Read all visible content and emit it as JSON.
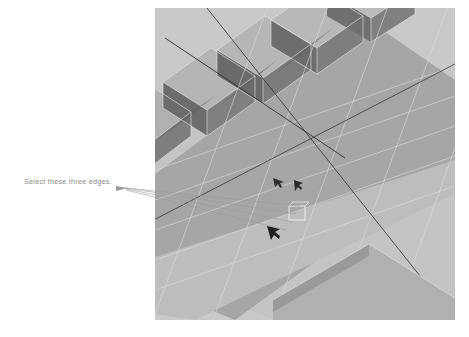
{
  "page": {
    "width": 469,
    "height": 337,
    "background": "#ffffff"
  },
  "annotation": {
    "label": "Select these three edges.",
    "text_color": "#8a8a8a",
    "leader_line_color": "#9a9a9a",
    "leader_count": 3,
    "text_position": {
      "x": 24,
      "y": 177
    },
    "converge_point": {
      "x": 296,
      "y": 216
    }
  },
  "viewport": {
    "name": "3d-modeling-viewport",
    "x": 155,
    "y": 8,
    "width": 300,
    "height": 312,
    "background": "#c9c9c9",
    "colors": {
      "background": "#c9c9c9",
      "top_face": "#c2c2c2",
      "mid_band": "#a4a4a4",
      "shadow_face": "#6f6f6f",
      "ridge_side": "#7d7d7d",
      "wireframe": "#d6d6d6",
      "dark_edge": "#3a3a3a",
      "selection_box": "#f2f2f2",
      "cursor_glyph": "#2e2e2e"
    },
    "ridges": {
      "count": 5,
      "description": "parallel extruded fins across upper slab"
    },
    "selection": {
      "marker": "small wireframe box at edge convergence",
      "x": 296,
      "y": 212
    },
    "cursors": [
      {
        "name": "vertex-cursor-glyph",
        "x": 276,
        "y": 181
      },
      {
        "name": "edge-cursor-glyph",
        "x": 295,
        "y": 184
      }
    ]
  }
}
